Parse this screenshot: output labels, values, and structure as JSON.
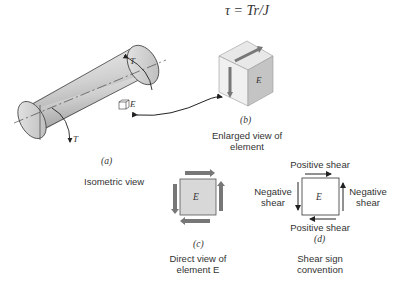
{
  "equation": "τ = Tr/J",
  "panels": {
    "a": {
      "tag": "(a)",
      "caption": "Isometric view",
      "torque_label": "T",
      "element_label": "E"
    },
    "b": {
      "tag": "(b)",
      "caption_line1": "Enlarged view of",
      "caption_line2": "element",
      "element_label": "E"
    },
    "c": {
      "tag": "(c)",
      "caption_line1": "Direct view of",
      "caption_line2": "element E",
      "element_label": "E"
    },
    "d": {
      "tag": "(d)",
      "caption_line1": "Shear sign",
      "caption_line2": "convention",
      "element_label": "E",
      "top_label": "Positive shear",
      "bottom_label": "Positive shear",
      "left_label_1": "Negative",
      "left_label_2": "shear",
      "right_label_1": "Negative",
      "right_label_2": "shear"
    }
  },
  "colors": {
    "shaft": "#c8c8c8",
    "arrow": "#777777",
    "element_fill": "#d8d8d8",
    "line": "#333333"
  }
}
